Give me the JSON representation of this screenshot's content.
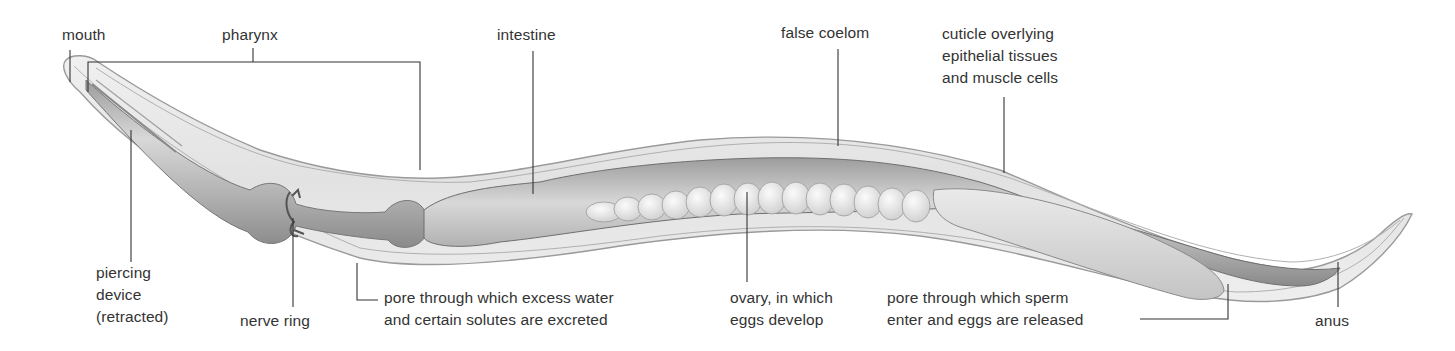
{
  "figure": {
    "colors": {
      "background": "#ffffff",
      "body_wall": "#e6e6e6",
      "body_outline": "#9a9a9a",
      "gut": "#b9b9b9",
      "gut_dark": "#8f8f8f",
      "eggs": "#ececec",
      "ovary_tail": "#dcdcdc",
      "leader_line": "#333333",
      "text": "#333333"
    }
  },
  "labels": {
    "mouth": [
      "mouth"
    ],
    "pharynx": [
      "pharynx"
    ],
    "intestine": [
      "intestine"
    ],
    "false_coelom": [
      "false coelom"
    ],
    "cuticle": [
      "cuticle overlying",
      "epithelial tissues",
      "and muscle cells"
    ],
    "piercing_device": [
      "piercing",
      "device",
      "(retracted)"
    ],
    "nerve_ring": [
      "nerve ring"
    ],
    "excretory_pore": [
      "pore through which excess water",
      "and certain solutes are excreted"
    ],
    "ovary": [
      "ovary, in which",
      "eggs develop"
    ],
    "genital_pore": [
      "pore through which sperm",
      "enter and eggs are released"
    ],
    "anus": [
      "anus"
    ]
  }
}
